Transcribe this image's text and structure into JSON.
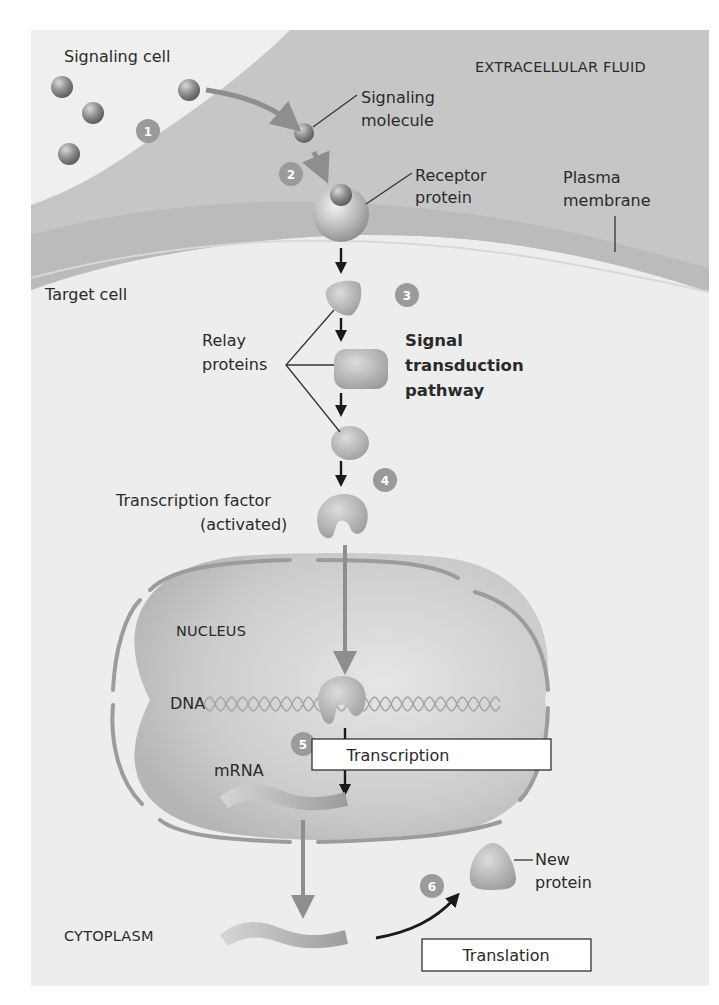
{
  "colors": {
    "page": "#ffffff",
    "cytoplasm": "#ededed",
    "extracellular": "#c9c9c9",
    "membrane": "#bcbcbc",
    "nucleus": "#cfcfcf",
    "molecule": "#8a8a8a",
    "step_badge": "#9a9a9a",
    "arrow_gray": "#8e8e8e",
    "arrow_black": "#1a1a1a"
  },
  "regions": {
    "signaling_cell": "Signaling cell",
    "extracellular_fluid": "EXTRACELLULAR FLUID",
    "target_cell": "Target cell",
    "nucleus": "NUCLEUS",
    "cytoplasm": "CYTOPLASM"
  },
  "labels": {
    "signaling_molecule": [
      "Signaling",
      "molecule"
    ],
    "receptor_protein": [
      "Receptor",
      "protein"
    ],
    "plasma_membrane": [
      "Plasma",
      "membrane"
    ],
    "relay_proteins": [
      "Relay",
      "proteins"
    ],
    "signal_transduction_pathway": [
      "Signal",
      "transduction",
      "pathway"
    ],
    "transcription_factor": [
      "Transcription factor",
      "(activated)"
    ],
    "dna": "DNA",
    "mrna": "mRNA",
    "new_protein": [
      "New",
      "protein"
    ]
  },
  "boxes": {
    "transcription": "Transcription",
    "translation": "Translation"
  },
  "steps": [
    "1",
    "2",
    "3",
    "4",
    "5",
    "6"
  ]
}
